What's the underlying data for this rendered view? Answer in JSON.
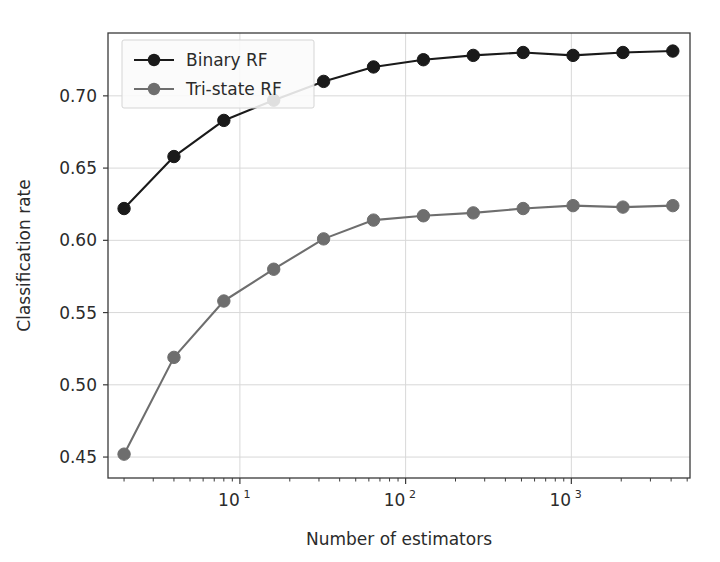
{
  "chart_data": {
    "type": "line",
    "title": "",
    "xlabel": "Number of estimators",
    "ylabel": "Classification rate",
    "xscale": "log",
    "yscale": "linear",
    "xlim": [
      1.6,
      5200
    ],
    "ylim": [
      0.4355,
      0.7435
    ],
    "grid": true,
    "legend_position": "upper left",
    "x": [
      2,
      4,
      8,
      16,
      32,
      64,
      128,
      256,
      512,
      1024,
      2048,
      4096
    ],
    "xtick_labels": [
      "10^1",
      "10^2",
      "10^3"
    ],
    "xtick_values": [
      10,
      100,
      1000
    ],
    "ytick_labels": [
      "0.45",
      "0.50",
      "0.55",
      "0.60",
      "0.65",
      "0.70"
    ],
    "ytick_values": [
      0.45,
      0.5,
      0.55,
      0.6,
      0.65,
      0.7
    ],
    "series": [
      {
        "name": "Binary RF",
        "color": "#1a1a1a",
        "marker": "circle",
        "values": [
          0.622,
          0.658,
          0.683,
          0.697,
          0.71,
          0.72,
          0.725,
          0.728,
          0.73,
          0.728,
          0.73,
          0.731
        ]
      },
      {
        "name": "Tri-state RF",
        "color": "#6e6e6e",
        "marker": "circle",
        "values": [
          0.452,
          0.519,
          0.558,
          0.58,
          0.601,
          0.614,
          0.617,
          0.619,
          0.622,
          0.624,
          0.623,
          0.624
        ]
      }
    ]
  },
  "figure": {
    "background_color": "#ffffff",
    "axes_color": "#3a3a3a",
    "grid_color": "#d8d8d8"
  }
}
